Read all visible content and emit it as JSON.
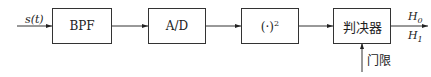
{
  "diagram": {
    "input_label": "s(t)",
    "blocks": [
      {
        "id": "bpf",
        "label": "BPF"
      },
      {
        "id": "ad",
        "label": "A/D"
      },
      {
        "id": "square",
        "label": "(·)",
        "superscript": "2"
      },
      {
        "id": "decision",
        "label": "判决器"
      }
    ],
    "outputs": [
      {
        "label": "H",
        "subscript": "0"
      },
      {
        "label": "H",
        "subscript": "1"
      }
    ],
    "threshold_label": "门限"
  }
}
